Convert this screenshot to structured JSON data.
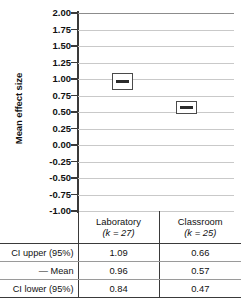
{
  "figure": {
    "axis_title": "Mean effect size"
  },
  "chart_data": {
    "type": "scatter",
    "title": "",
    "xlabel": "",
    "ylabel": "Mean effect size",
    "ylim": [
      -1.0,
      2.0
    ],
    "ytick_step": 0.25,
    "grid": true,
    "legend": "none",
    "tick_labels": [
      "2.00",
      "1.75",
      "1.50",
      "1.25",
      "1.00",
      "0.75",
      "0.50",
      "0.25",
      "0.00",
      "-0.25",
      "-0.50",
      "-0.75",
      "-1.00"
    ],
    "tick_values": [
      2.0,
      1.75,
      1.5,
      1.25,
      1.0,
      0.75,
      0.5,
      0.25,
      0.0,
      -0.25,
      -0.5,
      -0.75,
      -1.0
    ],
    "categories": [
      "Laboratory",
      "Classroom"
    ],
    "series": [
      {
        "name": "Mean effect size with 95% CI",
        "points": [
          {
            "category": "Laboratory",
            "k": 27,
            "mean": 0.96,
            "ci_lower": 0.84,
            "ci_upper": 1.09
          },
          {
            "category": "Classroom",
            "k": 25,
            "mean": 0.57,
            "ci_lower": 0.47,
            "ci_upper": 0.66
          }
        ]
      }
    ]
  },
  "table": {
    "header": {
      "corner": "",
      "columns": [
        {
          "name": "Laboratory",
          "sub": "(k = 27)"
        },
        {
          "name": "Classroom",
          "sub": "(k = 25)"
        }
      ]
    },
    "rows": [
      {
        "label": "CI upper (95%)",
        "values": [
          "1.09",
          "0.66"
        ]
      },
      {
        "label": "— Mean",
        "values": [
          "0.96",
          "0.57"
        ]
      },
      {
        "label": "CI lower (95%)",
        "values": [
          "0.84",
          "0.47"
        ]
      }
    ]
  },
  "colors": {
    "grid": "#c9c9c9",
    "axis": "#3a3a3a",
    "marker_border": "#4a4a4a",
    "mean_line": "#2b2b2b",
    "text": "#111111",
    "background": "#ffffff"
  }
}
